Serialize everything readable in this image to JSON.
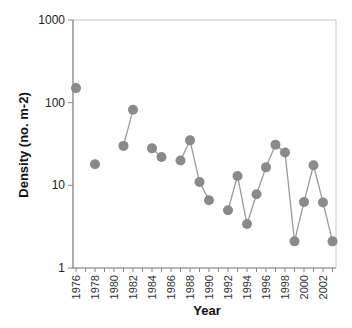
{
  "chart_data": {
    "type": "scatter",
    "title": "",
    "xlabel": "Year",
    "ylabel": "Density (no. m-2)",
    "yscale": "log",
    "ylim": [
      1,
      1000
    ],
    "xlim": [
      1975.5,
      2003.5
    ],
    "y_ticks": [
      "1",
      "10",
      "100",
      "1000"
    ],
    "x_ticks": [
      "1976",
      "1978",
      "1980",
      "1982",
      "1984",
      "1986",
      "1988",
      "1990",
      "1992",
      "1994",
      "1996",
      "1998",
      "2000",
      "2002"
    ],
    "grid": false,
    "legend": null,
    "marker_color": "#8a8a8a",
    "line_color": "#9a9a9a",
    "series": [
      {
        "name": "Density",
        "points": [
          {
            "x": 1976,
            "y": 150
          },
          {
            "x": 1978,
            "y": 18
          },
          {
            "x": 1981,
            "y": 30
          },
          {
            "x": 1982,
            "y": 82
          },
          {
            "x": 1984,
            "y": 28
          },
          {
            "x": 1985,
            "y": 22
          },
          {
            "x": 1987,
            "y": 20
          },
          {
            "x": 1988,
            "y": 35
          },
          {
            "x": 1989,
            "y": 11
          },
          {
            "x": 1990,
            "y": 6.6
          },
          {
            "x": 1992,
            "y": 5
          },
          {
            "x": 1993,
            "y": 13
          },
          {
            "x": 1994,
            "y": 3.4
          },
          {
            "x": 1995,
            "y": 7.8
          },
          {
            "x": 1996,
            "y": 16.5
          },
          {
            "x": 1997,
            "y": 31
          },
          {
            "x": 1998,
            "y": 25
          },
          {
            "x": 1999,
            "y": 2.1
          },
          {
            "x": 2000,
            "y": 6.3
          },
          {
            "x": 2001,
            "y": 17.5
          },
          {
            "x": 2002,
            "y": 6.2
          },
          {
            "x": 2003,
            "y": 2.1
          }
        ],
        "connected_segments": [
          [
            1981,
            1982
          ],
          [
            1984,
            1985
          ],
          [
            1987,
            1988,
            1989,
            1990
          ],
          [
            1992,
            1993,
            1994,
            1995,
            1996,
            1997,
            1998,
            1999,
            2000,
            2001,
            2002,
            2003
          ]
        ]
      }
    ]
  }
}
